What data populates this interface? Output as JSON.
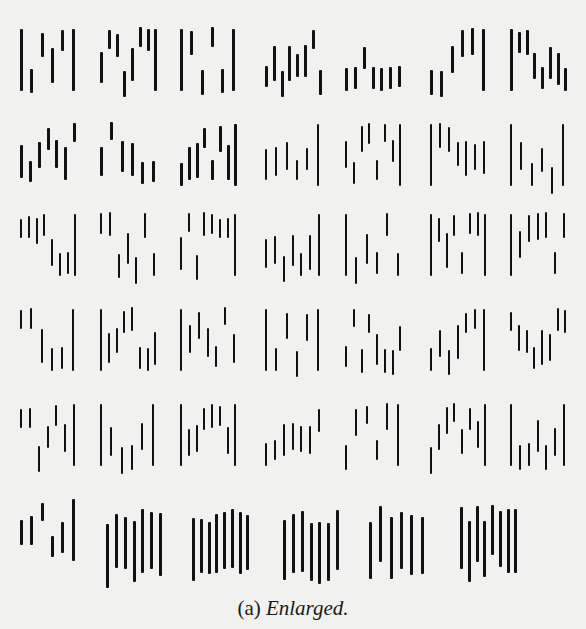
{
  "figure": {
    "caption_label": "(a)",
    "caption_text": "Enlarged.",
    "rows": [
      [
        "1",
        "2",
        "3",
        "4",
        "5",
        "6",
        "7"
      ],
      [
        "8",
        "9",
        "0",
        "A",
        "B",
        "C",
        "D"
      ],
      [
        "E",
        "F",
        "G",
        "H",
        "I",
        "J",
        "K"
      ],
      [
        "L",
        "M",
        "N",
        "O",
        "P",
        "Q",
        "R"
      ],
      [
        "S",
        "T",
        "U",
        "V",
        "W",
        "X",
        "Y"
      ],
      [
        "Z",
        "sym1",
        "sym2",
        "sym3",
        "sym4",
        "sym5"
      ]
    ],
    "colors": {
      "background": "#f1f1ef",
      "ink": "#111111"
    }
  }
}
